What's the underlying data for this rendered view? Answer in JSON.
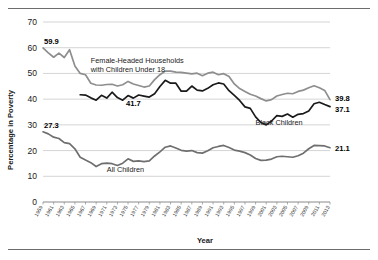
{
  "figure": {
    "frame_top_rule": true,
    "frame_bottom_rule": true,
    "background": "#ffffff"
  },
  "labels": {
    "ylabel": "Percentage in Poverty",
    "xlabel": "Year",
    "annotation_female_line1": "Female-Headed Households",
    "annotation_female_line2": "with Children Under 18",
    "annotation_black": "Black Children",
    "annotation_all": "All Children",
    "start_female": "59.9",
    "start_all": "27.3",
    "mid_black": "41.7",
    "end_female": "39.8",
    "end_black": "37.1",
    "end_all": "21.1"
  },
  "colors": {
    "female_headed": "#8e8e8e",
    "black_children": "#1a1a1a",
    "all_children": "#6f6f6f",
    "grid": "#c9c9c9",
    "axis": "#8a8a8a",
    "text": "#1a1a1a",
    "rule": "#6d6d6d"
  },
  "chart_data": {
    "type": "line",
    "title": "",
    "subtitle": "",
    "xlabel": "Year",
    "ylabel": "Percentage in Poverty",
    "xlim": [
      1959,
      2013
    ],
    "ylim": [
      0,
      70
    ],
    "yticks": [
      0,
      10,
      20,
      30,
      40,
      50,
      60,
      70
    ],
    "ytick_labels": [
      "0",
      "10",
      "20",
      "30",
      "40",
      "50",
      "60",
      "70"
    ],
    "grid": "horizontal",
    "legend": "inline-annotations",
    "xticks": [
      1959,
      1961,
      1963,
      1965,
      1967,
      1969,
      1971,
      1973,
      1975,
      1977,
      1979,
      1981,
      1983,
      1985,
      1987,
      1989,
      1991,
      1993,
      1995,
      1997,
      1999,
      2001,
      2003,
      2005,
      2007,
      2009,
      2011,
      2013
    ],
    "xtick_labels": [
      "1959",
      "1961",
      "1963",
      "1965",
      "1967",
      "1969",
      "1971",
      "1973",
      "1975",
      "1977",
      "1979",
      "1981",
      "1983",
      "1985",
      "1987",
      "1989",
      "1991",
      "1993",
      "1995",
      "1997",
      "1999",
      "2001",
      "2003",
      "2005",
      "2007",
      "2009",
      "2011",
      "2013"
    ],
    "x": [
      1959,
      1960,
      1961,
      1962,
      1963,
      1964,
      1965,
      1966,
      1967,
      1968,
      1969,
      1970,
      1971,
      1972,
      1973,
      1974,
      1975,
      1976,
      1977,
      1978,
      1979,
      1980,
      1981,
      1982,
      1983,
      1984,
      1985,
      1986,
      1987,
      1988,
      1989,
      1990,
      1991,
      1992,
      1993,
      1994,
      1995,
      1996,
      1997,
      1998,
      1999,
      2000,
      2001,
      2002,
      2003,
      2004,
      2005,
      2006,
      2007,
      2008,
      2009,
      2010,
      2011,
      2012,
      2013
    ],
    "series": [
      {
        "name": "Female-Headed Households with Children Under 18",
        "color": "#8e8e8e",
        "start_label": "59.9",
        "end_label": "39.8",
        "values": [
          59.9,
          58.0,
          56.3,
          57.9,
          56.2,
          59.2,
          52.9,
          50.0,
          49.5,
          46.2,
          45.5,
          45.4,
          45.7,
          45.8,
          45.1,
          45.6,
          46.9,
          45.9,
          45.3,
          44.7,
          45.1,
          47.6,
          49.5,
          50.9,
          50.9,
          50.5,
          50.4,
          50.1,
          49.8,
          50.1,
          49.1,
          50.1,
          50.5,
          49.5,
          49.9,
          48.8,
          45.9,
          44.1,
          43.0,
          41.9,
          41.2,
          40.2,
          39.3,
          39.8,
          41.2,
          41.8,
          42.3,
          42.1,
          43.0,
          43.5,
          44.4,
          45.2,
          44.4,
          43.4,
          39.8
        ]
      },
      {
        "name": "Black Children",
        "color": "#1a1a1a",
        "start_year": 1966,
        "mid_label": "41.7",
        "end_label": "37.1",
        "values": [
          null,
          null,
          null,
          null,
          null,
          null,
          null,
          41.7,
          41.6,
          40.5,
          39.6,
          41.5,
          40.4,
          42.7,
          40.6,
          39.6,
          41.4,
          40.4,
          41.6,
          41.2,
          40.8,
          42.1,
          44.9,
          47.3,
          46.2,
          46.2,
          43.1,
          43.1,
          45.1,
          43.5,
          43.2,
          44.2,
          45.6,
          46.3,
          45.9,
          43.3,
          41.5,
          39.5,
          37.0,
          36.4,
          33.1,
          30.9,
          30.0,
          31.5,
          33.6,
          33.3,
          34.2,
          33.0,
          34.1,
          34.4,
          35.4,
          38.2,
          38.8,
          37.9,
          37.1
        ]
      },
      {
        "name": "All Children",
        "color": "#6f6f6f",
        "start_label": "27.3",
        "end_label": "21.1",
        "values": [
          27.3,
          26.5,
          25.2,
          24.7,
          23.1,
          22.7,
          20.7,
          17.4,
          16.3,
          15.3,
          13.8,
          14.9,
          15.1,
          14.9,
          14.2,
          15.1,
          16.8,
          15.8,
          16.0,
          15.7,
          16.0,
          17.9,
          19.5,
          21.3,
          21.8,
          21.0,
          20.1,
          19.8,
          20.0,
          19.2,
          19.0,
          19.9,
          21.1,
          21.6,
          22.0,
          21.2,
          20.2,
          19.8,
          19.2,
          18.3,
          16.9,
          16.2,
          16.3,
          16.7,
          17.6,
          17.8,
          17.6,
          17.4,
          18.0,
          19.0,
          20.7,
          22.0,
          21.9,
          21.8,
          21.1
        ]
      }
    ],
    "annotations": [
      {
        "text": "Female-Headed Households",
        "x": 1968,
        "y": 54
      },
      {
        "text": "with Children Under 18",
        "x": 1968,
        "y": 50.5
      },
      {
        "text": "Black Children",
        "x": 1999,
        "y": 30
      },
      {
        "text": "All Children",
        "x": 1971,
        "y": 11.5
      }
    ]
  }
}
